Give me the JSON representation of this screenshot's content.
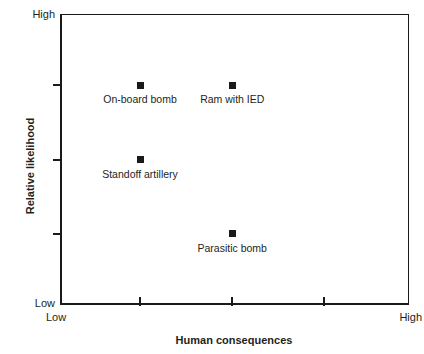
{
  "chart_data": {
    "type": "scatter",
    "title": "",
    "xlabel": "Human consequences",
    "ylabel": "Relative likelihood",
    "xlim": [
      0,
      100
    ],
    "ylim": [
      0,
      100
    ],
    "grid": false,
    "legend": null,
    "axis_tick_labels": {
      "x_start": "Low",
      "x_end": "High",
      "y_start": "Low",
      "y_end": "High"
    },
    "x_ticks": [
      23,
      49.5,
      76
    ],
    "y_ticks": [
      24.5,
      50,
      75.5
    ],
    "points": [
      {
        "label": "On-board bomb",
        "x": 23,
        "y": 75.5,
        "label_position": "below"
      },
      {
        "label": "Ram with IED",
        "x": 49.5,
        "y": 75.5,
        "label_position": "below"
      },
      {
        "label": "Standoff artillery",
        "x": 23,
        "y": 50,
        "label_position": "below"
      },
      {
        "label": "Parasitic bomb",
        "x": 49.5,
        "y": 24.5,
        "label_position": "below"
      }
    ],
    "marker": {
      "shape": "square",
      "color": "#1a1a1a",
      "size_px": 7
    },
    "axis_color": "#1a1a1a",
    "background_color": "#ffffff",
    "text_color": "#231f20"
  }
}
